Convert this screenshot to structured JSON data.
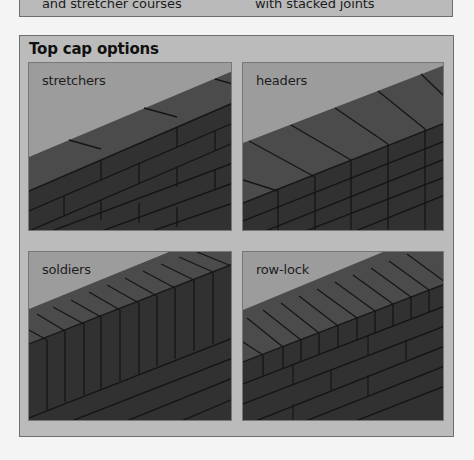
{
  "caption": {
    "left_text": "and stretcher courses",
    "right_text": "with stacked joints"
  },
  "figure": {
    "title": "Top cap options",
    "colors": {
      "frame_bg": "#bbbbbb",
      "sky": "#9c9c9c",
      "cap_top": "#4b4b4b",
      "brick_face": "#303030",
      "mortar": "#141414"
    },
    "panels": [
      {
        "label": "stretchers",
        "cap_type": "stretchers"
      },
      {
        "label": "headers",
        "cap_type": "headers"
      },
      {
        "label": "soldiers",
        "cap_type": "soldiers"
      },
      {
        "label": "row-lock",
        "cap_type": "row-lock"
      }
    ]
  }
}
